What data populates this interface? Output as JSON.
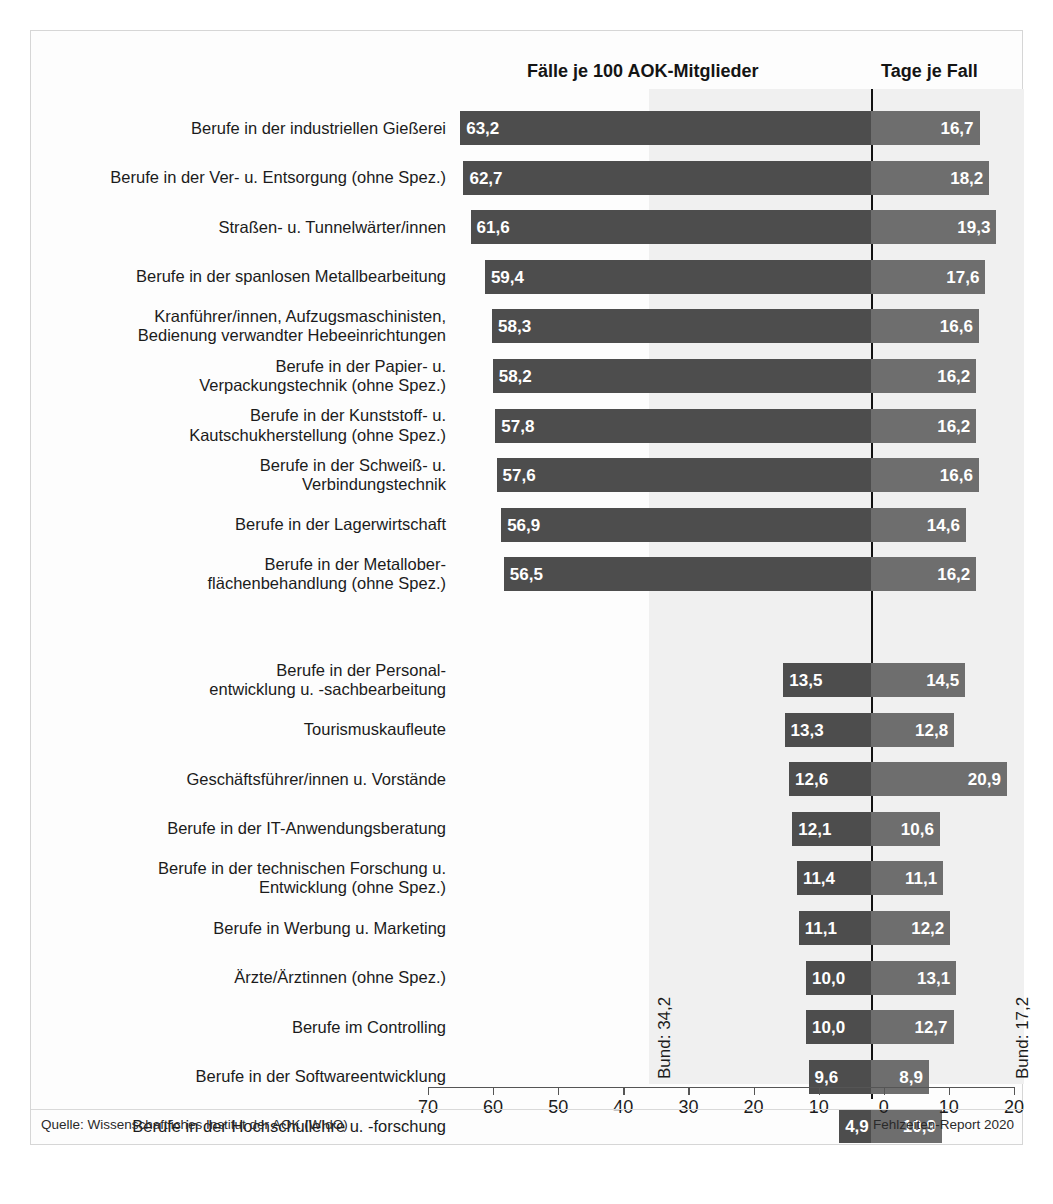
{
  "headers": {
    "left_column": "Fälle je 100 AOK-Mitglieder",
    "right_column": "Tage je Fall"
  },
  "annotations": {
    "bund_left": "Bund: 34,2",
    "bund_right": "Bund: 17,2"
  },
  "footer": {
    "source": "Quelle: Wissenschaftliches Institut der AOK (WIdO)",
    "report": "Fehlzeiten-Report 2020"
  },
  "colors": {
    "bar_left": "#4d4d4d",
    "bar_right": "#6e6e6e",
    "shade_band": "#f0f0f0",
    "zero_line": "#111111",
    "frame": "#d6d6d6",
    "text": "#1b1b1b"
  },
  "chart_data": {
    "type": "bar",
    "title": "",
    "subtitle": "",
    "orientation": "horizontal",
    "layout": "diverging-dual-axis",
    "xlabel": "",
    "ylabel": "",
    "grid": false,
    "legend_position": "top",
    "axis": {
      "tick_labels": [
        "70",
        "60",
        "50",
        "40",
        "30",
        "20",
        "10",
        "0",
        "10",
        "20"
      ],
      "tick_values": [
        70,
        60,
        50,
        40,
        30,
        20,
        10,
        0,
        10,
        20
      ],
      "left_range": [
        70,
        0
      ],
      "right_range": [
        0,
        20
      ],
      "units_per_pixel": 0.1538
    },
    "reference_lines": [
      {
        "name": "Bund Fälle je 100 AOK-Mitglieder",
        "side": "left",
        "value": 34.2,
        "label": "Bund: 34,2"
      },
      {
        "name": "Bund Tage je Fall",
        "side": "right",
        "value": 17.2,
        "label": "Bund: 17,2"
      }
    ],
    "categories": [
      "Berufe in der industriellen Gießerei",
      "Berufe in der Ver- u. Entsorgung (ohne Spez.)",
      "Straßen- u. Tunnelwärter/innen",
      "Berufe in der spanlosen Metallbearbeitung",
      "Kranführer/innen, Aufzugsmaschinisten,\nBedienung verwandter Hebeeinrichtungen",
      "Berufe in der Papier- u.\nVerpackungstechnik (ohne Spez.)",
      "Berufe in der Kunststoff- u.\nKautschukherstellung (ohne Spez.)",
      "Berufe in der Schweiß- u.\nVerbindungstechnik",
      "Berufe in der Lagerwirtschaft",
      "Berufe in der Metallober-\nflächenbehandlung (ohne Spez.)",
      "Berufe in der Personal-\nentwicklung u. -sachbearbeitung",
      "Tourismuskaufleute",
      "Geschäftsführer/innen u. Vorstände",
      "Berufe in der IT-Anwendungsberatung",
      "Berufe in der technischen Forschung u.\nEntwicklung (ohne Spez.)",
      "Berufe in Werbung u. Marketing",
      "Ärzte/Ärztinnen (ohne Spez.)",
      "Berufe im Controlling",
      "Berufe in der Softwareentwicklung",
      "Berufe in der Hochschullehre u. -forschung"
    ],
    "series": [
      {
        "name": "Fälle je 100 AOK-Mitglieder",
        "side": "left",
        "values": [
          63.2,
          62.7,
          61.6,
          59.4,
          58.3,
          58.2,
          57.8,
          57.6,
          56.9,
          56.5,
          13.5,
          13.3,
          12.6,
          12.1,
          11.4,
          11.1,
          10.0,
          10.0,
          9.6,
          4.9
        ],
        "labels": [
          "63,2",
          "62,7",
          "61,6",
          "59,4",
          "58,3",
          "58,2",
          "57,8",
          "57,6",
          "56,9",
          "56,5",
          "13,5",
          "13,3",
          "12,6",
          "12,1",
          "11,4",
          "11,1",
          "10,0",
          "10,0",
          "9,6",
          "4,9"
        ]
      },
      {
        "name": "Tage je Fall",
        "side": "right",
        "values": [
          16.7,
          18.2,
          19.3,
          17.6,
          16.6,
          16.2,
          16.2,
          16.6,
          14.6,
          16.2,
          14.5,
          12.8,
          20.9,
          10.6,
          11.1,
          12.2,
          13.1,
          12.7,
          8.9,
          10.9
        ],
        "labels": [
          "16,7",
          "18,2",
          "19,3",
          "17,6",
          "16,6",
          "16,2",
          "16,2",
          "16,6",
          "14,6",
          "16,2",
          "14,5",
          "12,8",
          "20,9",
          "10,6",
          "11,1",
          "12,2",
          "13,1",
          "12,7",
          "8,9",
          "10,9"
        ]
      }
    ],
    "group_gap_after_index": 9
  }
}
